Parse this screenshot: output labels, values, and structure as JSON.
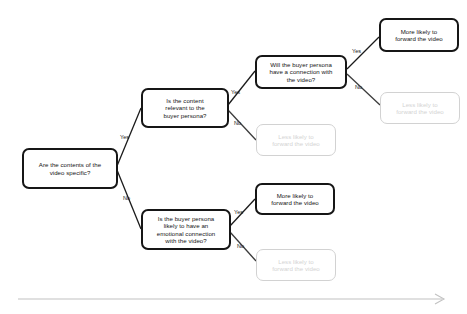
{
  "diagram": {
    "colors": {
      "strong_border": "#161616",
      "faded_border": "#d2d2d2",
      "faded_text": "#d3d3d3",
      "edge_strong": "#1b1b1b",
      "edge_faded": "#c9c9c9",
      "timeline_arrow": "#c2c2c2",
      "background": "#ffffff"
    },
    "nodes": [
      {
        "id": "q1",
        "text": "Are the contents of the\nvideo specific?",
        "style": "strong"
      },
      {
        "id": "q2",
        "text": "Is the content\nrelevant to the\nbuyer persona?",
        "style": "strong"
      },
      {
        "id": "q3",
        "text": "Will the buyer persona\nhave a connection with\nthe video?",
        "style": "strong"
      },
      {
        "id": "q4",
        "text": "Is the buyer persona\nlikely to have an\nemotional connection\nwith the video?",
        "style": "strong"
      },
      {
        "id": "r1",
        "text": "More likely to\nforward the video",
        "style": "strong"
      },
      {
        "id": "r2",
        "text": "Less likely to\nforward the video",
        "style": "faded"
      },
      {
        "id": "r3",
        "text": "Less likely to\nforward the video",
        "style": "faded"
      },
      {
        "id": "r4",
        "text": "More likely to\nforward the video",
        "style": "strong"
      },
      {
        "id": "r5",
        "text": "Less likely to\nforward the video",
        "style": "faded"
      }
    ],
    "edge_labels": [
      {
        "id": "q1-yes",
        "text": "Yes"
      },
      {
        "id": "q1-no",
        "text": "No"
      },
      {
        "id": "q2-yes",
        "text": "Yes"
      },
      {
        "id": "q2-no",
        "text": "No"
      },
      {
        "id": "q3-yes",
        "text": "Yes"
      },
      {
        "id": "q3-no",
        "text": "No"
      },
      {
        "id": "q4-yes",
        "text": "Yes"
      },
      {
        "id": "q4-no",
        "text": "No"
      }
    ]
  }
}
